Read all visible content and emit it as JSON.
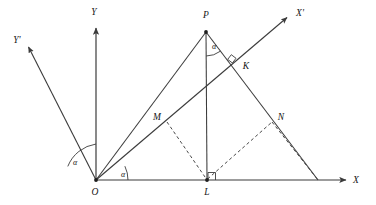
{
  "figure": {
    "background_color": "#ffffff",
    "stroke_color": "#3b3b3b",
    "width": 376,
    "height": 205
  },
  "axes": [
    {
      "id": "x-axis",
      "label": "X",
      "from": [
        96,
        180
      ],
      "to": [
        348,
        180
      ]
    },
    {
      "id": "y-axis",
      "label": "Y",
      "from": [
        96,
        180
      ],
      "to": [
        96,
        26
      ]
    },
    {
      "id": "x-prime",
      "label": "X'",
      "from": [
        96,
        180
      ],
      "to": [
        289,
        16
      ]
    },
    {
      "id": "y-prime",
      "label": "Y'",
      "from": [
        96,
        180
      ],
      "to": [
        26,
        45
      ]
    }
  ],
  "axis_labels": {
    "x": {
      "text": "X",
      "pos": [
        356,
        182
      ]
    },
    "y": {
      "text": "Y",
      "pos": [
        93,
        17
      ]
    },
    "xp": {
      "text": "X'",
      "pos": [
        296,
        15
      ]
    },
    "yp": {
      "text": "Y'",
      "pos": [
        12,
        42
      ]
    }
  },
  "points": [
    {
      "name": "O",
      "label": "O",
      "x": 96,
      "y": 180,
      "label_pos": [
        92,
        194
      ],
      "dot": true
    },
    {
      "name": "P",
      "label": "P",
      "x": 206,
      "y": 32,
      "label_pos": [
        202,
        16
      ],
      "dot": true
    },
    {
      "name": "K",
      "label": "K",
      "x": 237,
      "y": 64,
      "label_pos": [
        243,
        68
      ],
      "dot": false
    },
    {
      "name": "M",
      "label": "M",
      "x": 167,
      "y": 122,
      "label_pos": [
        155,
        120
      ],
      "dot": false
    },
    {
      "name": "N",
      "label": "N",
      "x": 272,
      "y": 122,
      "label_pos": [
        278,
        119
      ],
      "dot": false
    },
    {
      "name": "L",
      "label": "L",
      "x": 207,
      "y": 180,
      "label_pos": [
        203,
        194
      ],
      "dot": true
    }
  ],
  "solid_segments": [
    {
      "id": "segment-OP",
      "from": [
        96,
        180
      ],
      "to": [
        206,
        32
      ]
    },
    {
      "id": "segment-PL",
      "from": [
        206,
        32
      ],
      "to": [
        207,
        180
      ]
    },
    {
      "id": "segment-P-to-foot",
      "from": [
        206,
        32
      ],
      "to": [
        318,
        180
      ]
    }
  ],
  "dashed_segments": [
    {
      "id": "dashed-ML",
      "from": [
        167,
        122
      ],
      "to": [
        207,
        180
      ]
    },
    {
      "id": "dashed-LN",
      "from": [
        207,
        180
      ],
      "to": [
        272,
        122
      ]
    },
    {
      "id": "dashed-N-foot",
      "from": [
        272,
        122
      ],
      "to": [
        318,
        180
      ]
    }
  ],
  "angles": [
    {
      "id": "angle-alpha-origin-left",
      "label": "α",
      "label_pos": [
        70,
        163
      ],
      "vertex": [
        96,
        180
      ],
      "radius": 36,
      "from_deg": 90,
      "to_deg": 115.5
    },
    {
      "id": "angle-alpha-origin-right",
      "label": "α",
      "label_pos": [
        123,
        175
      ],
      "vertex": [
        96,
        180
      ],
      "radius": 32,
      "from_deg": 0,
      "to_deg": 25.5
    },
    {
      "id": "angle-alpha-at-P",
      "label": "α",
      "label_pos": [
        213,
        47
      ],
      "vertex": [
        206,
        32
      ],
      "radius": 24,
      "from_deg": -90,
      "to_deg": -53
    }
  ],
  "right_angle_marks": [
    {
      "id": "right-angle-at-K",
      "at": [
        237,
        64
      ],
      "note": "perpendicular of OX' and P-foot line"
    },
    {
      "id": "right-angle-at-L",
      "at": [
        207,
        180
      ],
      "note": "PL perpendicular to OX"
    }
  ],
  "legend_note": {
    "angle_symbol": "α",
    "description": "Both axis rotations and the angle at P are marked α"
  }
}
